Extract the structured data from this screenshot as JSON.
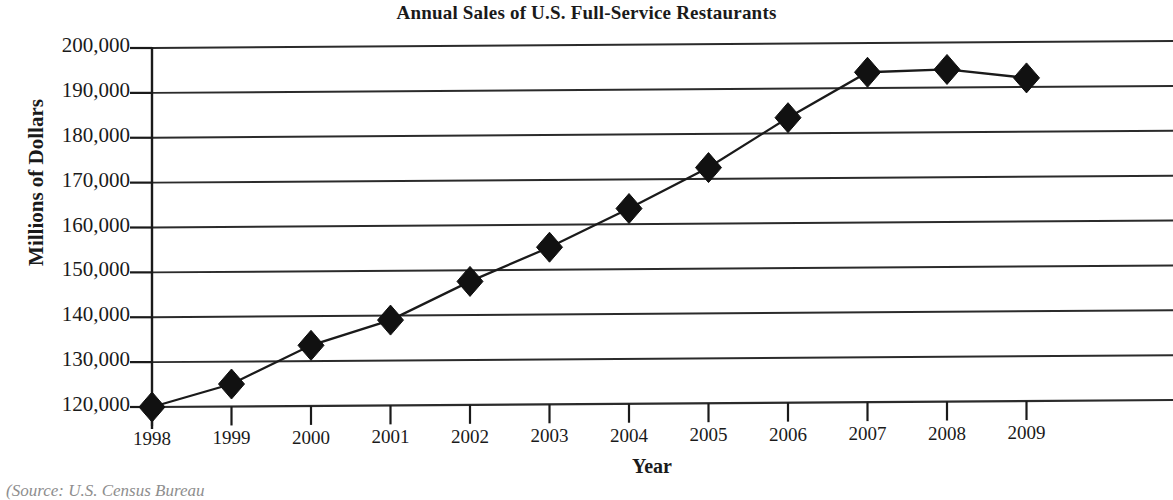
{
  "chart_data": {
    "type": "line",
    "title": "Annual Sales of U.S. Full-Service Restaurants",
    "xlabel": "Year",
    "ylabel": "Millions of Dollars",
    "categories": [
      "1998",
      "1999",
      "2000",
      "2001",
      "2002",
      "2003",
      "2004",
      "2005",
      "2006",
      "2007",
      "2008",
      "2009"
    ],
    "values": [
      120000,
      125000,
      133500,
      139000,
      147500,
      155000,
      163500,
      172500,
      183500,
      193500,
      194000,
      192000
    ],
    "series": [
      {
        "name": "Annual Sales",
        "values": [
          120000,
          125000,
          133500,
          139000,
          147500,
          155000,
          163500,
          172500,
          183500,
          193500,
          194000,
          192000
        ]
      }
    ],
    "ylim": [
      120000,
      200000
    ],
    "ytick_labels": [
      "200,000",
      "190,000",
      "180,000",
      "170,000",
      "160,000",
      "150,000",
      "140,000",
      "130,000",
      "120,000"
    ],
    "ytick_values": [
      200000,
      190000,
      180000,
      170000,
      160000,
      150000,
      140000,
      130000,
      120000
    ],
    "grid": "horizontal",
    "legend": "none",
    "marker": "diamond",
    "marker_color": "#111111",
    "line_color": "#1a1a1a"
  },
  "source_note": "(Source: U.S. Census Bureau",
  "colors": {
    "ink": "#1a1a1a",
    "gridline": "#2b2b2b",
    "background": "#ffffff"
  }
}
